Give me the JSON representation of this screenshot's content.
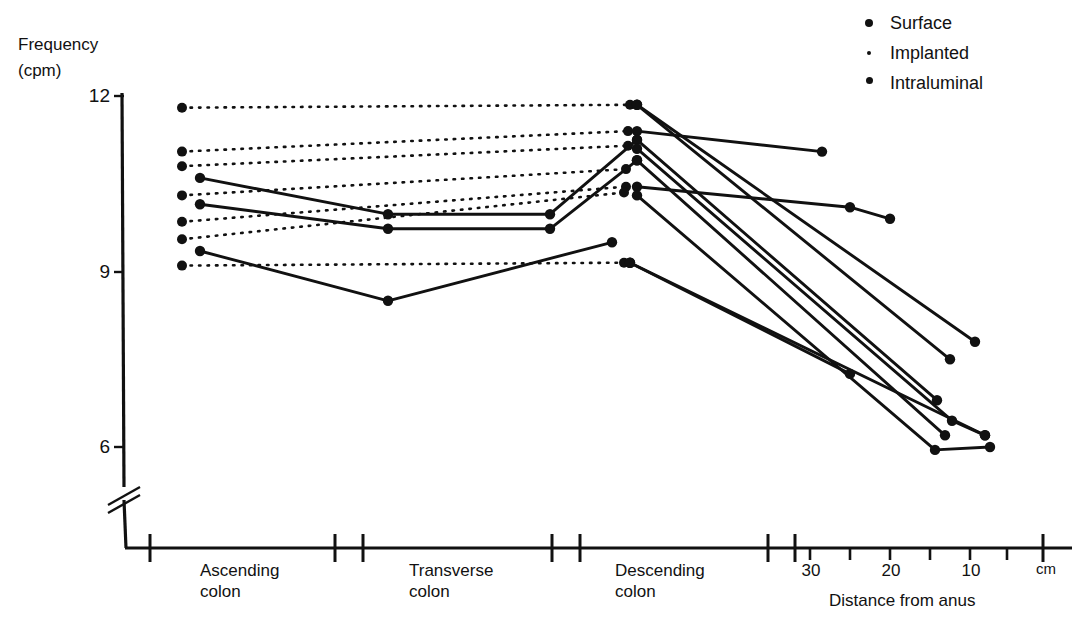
{
  "axes": {
    "y_title_line1": "Frequency",
    "y_title_line2": "(cpm)",
    "y_ticks": [
      "12",
      "9",
      "6"
    ],
    "x_title": "Distance from anus",
    "x_unit": "cm",
    "segment_labels": [
      "Ascending\ncolon",
      "Transverse\ncolon",
      "Descending\ncolon"
    ],
    "segment_ascending_l1": "Ascending",
    "segment_ascending_l2": "colon",
    "segment_transverse_l1": "Transverse",
    "segment_transverse_l2": "colon",
    "segment_descending_l1": "Descending",
    "segment_descending_l2": "colon",
    "distance_ticks": [
      "30",
      "20",
      "10"
    ]
  },
  "legend": {
    "items": [
      {
        "label": "Surface",
        "marker": "dot-large"
      },
      {
        "label": "Implanted",
        "marker": "dot-small"
      },
      {
        "label": "Intraluminal",
        "marker": "dot-medium"
      }
    ]
  },
  "colors": {
    "ink": "#111111",
    "background": "#ffffff"
  },
  "chart_data": {
    "type": "line",
    "title": "",
    "xlabel": "Distance from anus",
    "ylabel": "Frequency (cpm)",
    "ylim": [
      5.2,
      12.2
    ],
    "yticks": [
      6,
      9,
      12
    ],
    "grid": false,
    "legend_position": "top-right",
    "x_category_positions": {
      "ascending_intraluminal": 182,
      "ascending_surface": 200,
      "transverse": 388,
      "mid_descending": 550,
      "descending_intraluminal": 625,
      "descending_surface": 637
    },
    "distance_axis": {
      "30": 810,
      "20": 890,
      "10": 970,
      "0": 1043
    },
    "series": [
      {
        "name": "Intraluminal dotted 11.8",
        "style": "dotted",
        "marker": "dot-medium",
        "points": [
          [
            182,
            11.8
          ],
          [
            630,
            11.85
          ]
        ]
      },
      {
        "name": "Intraluminal dotted 11.05",
        "style": "dotted",
        "marker": "dot-medium",
        "points": [
          [
            182,
            11.05
          ],
          [
            628,
            11.4
          ]
        ]
      },
      {
        "name": "Intraluminal dotted 10.80",
        "style": "dotted",
        "marker": "dot-medium",
        "points": [
          [
            182,
            10.8
          ],
          [
            628,
            11.15
          ]
        ]
      },
      {
        "name": "Intraluminal dotted 10.30",
        "style": "dotted",
        "marker": "dot-medium",
        "points": [
          [
            182,
            10.3
          ],
          [
            626,
            10.75
          ]
        ]
      },
      {
        "name": "Intraluminal dotted 9.85",
        "style": "dotted",
        "marker": "dot-medium",
        "points": [
          [
            182,
            9.85
          ],
          [
            626,
            10.45
          ]
        ]
      },
      {
        "name": "Intraluminal dotted 9.55",
        "style": "dotted",
        "marker": "dot-medium",
        "points": [
          [
            182,
            9.55
          ],
          [
            624,
            10.35
          ]
        ]
      },
      {
        "name": "Intraluminal dotted 9.10",
        "style": "dotted",
        "marker": "dot-medium",
        "points": [
          [
            182,
            9.1
          ],
          [
            624,
            9.15
          ]
        ]
      },
      {
        "name": "Surface A 10.60",
        "style": "solid",
        "marker": "dot-large",
        "points": [
          [
            200,
            10.6
          ],
          [
            388,
            9.98
          ],
          [
            550,
            9.98
          ],
          [
            637,
            11.25
          ]
        ]
      },
      {
        "name": "Surface B 10.15",
        "style": "solid",
        "marker": "dot-large",
        "points": [
          [
            200,
            10.15
          ],
          [
            388,
            9.73
          ],
          [
            550,
            9.73
          ],
          [
            637,
            10.9
          ]
        ]
      },
      {
        "name": "Surface C 9.35",
        "style": "solid",
        "marker": "dot-large",
        "points": [
          [
            200,
            9.35
          ],
          [
            388,
            8.5
          ],
          [
            612,
            9.5
          ]
        ]
      },
      {
        "name": "Descending to rectum 11.85 long",
        "style": "solid",
        "marker": "dot-large",
        "points": [
          [
            637,
            11.85
          ],
          [
            975,
            7.8
          ]
        ]
      },
      {
        "name": "Descending to rectum 11.85 steeper",
        "style": "solid",
        "marker": "dot-large",
        "points": [
          [
            637,
            11.85
          ],
          [
            950,
            7.5
          ]
        ]
      },
      {
        "name": "Descending flat to 11.05",
        "style": "solid",
        "marker": "dot-large",
        "points": [
          [
            637,
            11.4
          ],
          [
            822,
            11.05
          ]
        ]
      },
      {
        "name": "Descending 11.25 to 6.80",
        "style": "solid",
        "marker": "dot-large",
        "points": [
          [
            637,
            11.25
          ],
          [
            937,
            6.8
          ]
        ]
      },
      {
        "name": "Descending 11.10 to 6.45",
        "style": "solid",
        "marker": "dot-large",
        "points": [
          [
            637,
            11.1
          ],
          [
            952,
            6.45
          ],
          [
            985,
            6.2
          ]
        ]
      },
      {
        "name": "Descending 10.90 to 6.20",
        "style": "solid",
        "marker": "dot-large",
        "points": [
          [
            637,
            10.9
          ],
          [
            945,
            6.2
          ]
        ]
      },
      {
        "name": "Descending 10.45 flat then down",
        "style": "solid",
        "marker": "dot-large",
        "points": [
          [
            637,
            10.45
          ],
          [
            850,
            10.1
          ],
          [
            890,
            9.9
          ]
        ]
      },
      {
        "name": "Descending 10.30 to 5.95",
        "style": "solid",
        "marker": "dot-large",
        "points": [
          [
            637,
            10.3
          ],
          [
            935,
            5.95
          ],
          [
            990,
            6.0
          ]
        ]
      },
      {
        "name": "Descending 9.15 to 7.25",
        "style": "solid",
        "marker": "dot-large",
        "points": [
          [
            630,
            9.15
          ],
          [
            850,
            7.25
          ]
        ]
      },
      {
        "name": "Descending 9.15 to 6.20 long",
        "style": "solid",
        "marker": "dot-large",
        "points": [
          [
            630,
            9.15
          ],
          [
            985,
            6.2
          ]
        ]
      }
    ]
  }
}
